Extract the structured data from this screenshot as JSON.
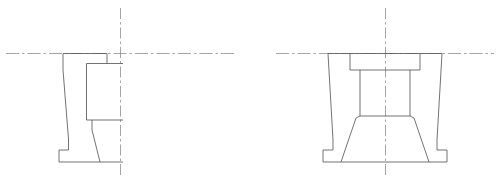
{
  "sheet": {
    "width": 499,
    "height": 185,
    "background": "#ffffff",
    "header_caption": "",
    "line_color": "#5a5a5f",
    "centerline_color": "#8e8e93",
    "header_color": "#b9b9bd"
  },
  "drawing": {
    "title": "",
    "description": "Two orthographic views of a symmetric flanged pedestal bracket",
    "views": [
      {
        "name": "half-section-view",
        "label": "",
        "center_x": 120,
        "baseline_y": 162,
        "top_y": 53,
        "outline_points": "63,53 63,150 59,150 59,162 120,162 120,53",
        "is_half": true
      },
      {
        "name": "front-elevation-view",
        "label": "",
        "center_x": 385,
        "baseline_y": 162,
        "top_y": 53,
        "outline_points": "328,53 328,150 322,150 322,162 448,162 448,150 442,150 442,53",
        "is_half": false
      }
    ],
    "centerlines": [
      {
        "name": "horizontal-centerline-left",
        "x1": 6,
        "y1": 53,
        "x2": 236,
        "y2": 53
      },
      {
        "name": "vertical-centerline-left",
        "x1": 120,
        "y1": 8,
        "x2": 120,
        "y2": 178
      },
      {
        "name": "horizontal-centerline-right",
        "x1": 276,
        "y1": 53,
        "x2": 494,
        "y2": 53
      },
      {
        "name": "vertical-centerline-right",
        "x1": 385,
        "y1": 8,
        "x2": 385,
        "y2": 178
      }
    ]
  }
}
